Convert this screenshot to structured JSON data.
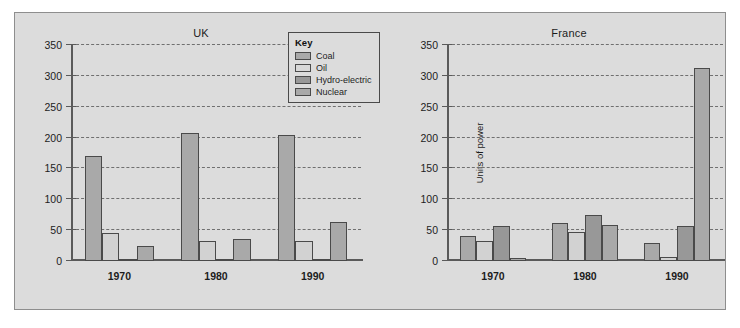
{
  "legend": {
    "title": "Key",
    "entries": [
      {
        "label": "Coal",
        "key": "coal",
        "color": "#a9a9a9"
      },
      {
        "label": "Oil",
        "key": "oil",
        "color": "#d8d8d8"
      },
      {
        "label": "Hydro-electric",
        "key": "hydro",
        "color": "#989898"
      },
      {
        "label": "Nuclear",
        "key": "nuclear",
        "color": "#a9a9a9"
      }
    ]
  },
  "chart_data": [
    {
      "type": "bar",
      "title": "UK",
      "xlabel": "",
      "ylabel": "",
      "categories": [
        "1970",
        "1980",
        "1990"
      ],
      "yticks": [
        0,
        50,
        100,
        150,
        200,
        250,
        300,
        350
      ],
      "ylim": [
        0,
        350
      ],
      "grid": true,
      "legend_position": "top-right",
      "series": [
        {
          "name": "Coal",
          "values": [
            170,
            207,
            205
          ]
        },
        {
          "name": "Oil",
          "values": [
            45,
            32,
            32
          ]
        },
        {
          "name": "Hydro-electric",
          "values": [
            4,
            3,
            3
          ]
        },
        {
          "name": "Nuclear",
          "values": [
            25,
            36,
            64
          ]
        }
      ]
    },
    {
      "type": "bar",
      "title": "France",
      "xlabel": "",
      "ylabel": "Units of power",
      "categories": [
        "1970",
        "1980",
        "1990"
      ],
      "yticks": [
        0,
        50,
        100,
        150,
        200,
        250,
        300,
        350
      ],
      "ylim": [
        0,
        350
      ],
      "grid": true,
      "legend_position": "shared",
      "series": [
        {
          "name": "Coal",
          "values": [
            40,
            62,
            30
          ]
        },
        {
          "name": "Oil",
          "values": [
            32,
            47,
            7
          ]
        },
        {
          "name": "Hydro-electric",
          "values": [
            56,
            75,
            56
          ]
        },
        {
          "name": "Nuclear",
          "values": [
            5,
            59,
            312
          ]
        }
      ]
    }
  ]
}
